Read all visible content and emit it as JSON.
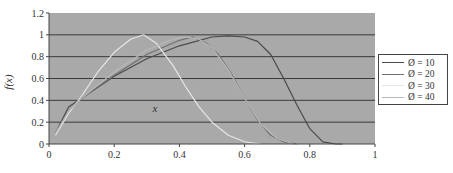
{
  "chart_data": {
    "type": "line",
    "title": "",
    "xlabel": "x",
    "ylabel": "f(x)",
    "xlim": [
      0,
      1
    ],
    "ylim": [
      0,
      1.2
    ],
    "xticks": [
      0,
      0.2,
      0.4,
      0.6,
      0.8,
      1
    ],
    "xtick_labels": [
      "0",
      "0.2",
      "0.4",
      "0.6",
      "0.8",
      "1"
    ],
    "yticks": [
      0,
      0.2,
      0.4,
      0.6,
      0.8,
      1,
      1.2
    ],
    "ytick_labels": [
      "0",
      "0.2",
      "0.4",
      "0.6",
      "0.8",
      "1",
      "1.2"
    ],
    "grid": "horizontal",
    "plot_background": "#a9a9a9",
    "legend_position": "right",
    "series": [
      {
        "name": "Ø = 10",
        "color": "#4a4a4a",
        "x": [
          0.02,
          0.06,
          0.1,
          0.2,
          0.3,
          0.4,
          0.5,
          0.55,
          0.6,
          0.64,
          0.68,
          0.72,
          0.76,
          0.8,
          0.84,
          0.88,
          0.9
        ],
        "y": [
          0.1,
          0.34,
          0.42,
          0.62,
          0.78,
          0.9,
          0.98,
          0.99,
          0.98,
          0.94,
          0.82,
          0.6,
          0.36,
          0.14,
          0.02,
          0.0,
          0.0
        ]
      },
      {
        "name": "Ø = 20",
        "color": "#707070",
        "x": [
          0.02,
          0.06,
          0.1,
          0.2,
          0.3,
          0.4,
          0.44,
          0.48,
          0.52,
          0.56,
          0.6,
          0.64,
          0.68,
          0.72,
          0.76
        ],
        "y": [
          0.1,
          0.3,
          0.42,
          0.63,
          0.82,
          0.95,
          0.98,
          0.93,
          0.82,
          0.64,
          0.42,
          0.22,
          0.08,
          0.02,
          0.0
        ]
      },
      {
        "name": "Ø = 30",
        "color": "#e6e6e6",
        "x": [
          0.02,
          0.06,
          0.1,
          0.15,
          0.2,
          0.25,
          0.29,
          0.33,
          0.38,
          0.42,
          0.46,
          0.5,
          0.55,
          0.6,
          0.65
        ],
        "y": [
          0.08,
          0.28,
          0.44,
          0.66,
          0.84,
          0.96,
          1.0,
          0.92,
          0.72,
          0.52,
          0.34,
          0.2,
          0.08,
          0.02,
          0.0
        ]
      },
      {
        "name": "Ø = 40",
        "color": "#b8b8b8",
        "x": [
          0.02,
          0.06,
          0.1,
          0.2,
          0.3,
          0.38,
          0.42,
          0.46,
          0.5,
          0.55,
          0.6,
          0.65,
          0.7,
          0.75
        ],
        "y": [
          0.1,
          0.3,
          0.42,
          0.66,
          0.86,
          0.96,
          0.98,
          0.96,
          0.88,
          0.68,
          0.42,
          0.18,
          0.05,
          0.0
        ]
      }
    ]
  },
  "labels": {
    "y_axis": "f(x)",
    "x_axis": "x"
  },
  "legend": {
    "items": [
      {
        "label": "Ø = 10",
        "color": "#4a4a4a"
      },
      {
        "label": "Ø = 20",
        "color": "#707070"
      },
      {
        "label": "Ø = 30",
        "color": "#e6e6e6"
      },
      {
        "label": "Ø = 40",
        "color": "#b8b8b8"
      }
    ]
  }
}
